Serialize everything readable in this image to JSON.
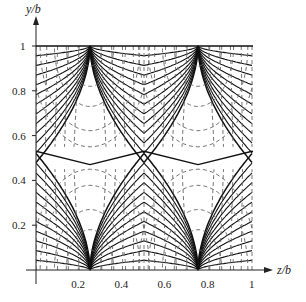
{
  "chart_data": {
    "type": "line",
    "title": "",
    "xlabel": "z/b",
    "ylabel": "y/b",
    "xlim": [
      0,
      1
    ],
    "ylim": [
      0,
      1
    ],
    "x_ticks": [
      "0.2",
      "0.4",
      "0.6",
      "0.8",
      "1"
    ],
    "y_ticks": [
      "0.2",
      "0.4",
      "0.6",
      "0.8",
      "1"
    ],
    "grid": false,
    "legend": [],
    "cusp_points": [
      {
        "z": 0.25,
        "y": 1.0
      },
      {
        "z": 0.75,
        "y": 1.0
      },
      {
        "z": 0.25,
        "y": 0.0
      },
      {
        "z": 0.75,
        "y": 0.0
      }
    ],
    "series": [
      {
        "name": "solid field lines",
        "style": "solid"
      },
      {
        "name": "dashed equipotentials",
        "style": "dashed"
      }
    ]
  },
  "axes": {
    "x_label": "z/b",
    "y_label": "y/b",
    "x_ticks": [
      "0.2",
      "0.4",
      "0.6",
      "0.8",
      "1"
    ],
    "y_ticks": [
      "0.2",
      "0.4",
      "0.6",
      "0.8",
      "1"
    ]
  }
}
